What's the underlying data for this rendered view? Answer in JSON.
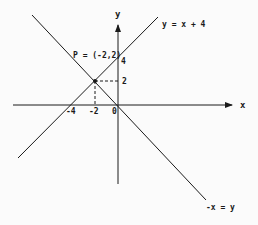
{
  "diagram": {
    "axes": {
      "x_label": "x",
      "y_label": "y",
      "origin_label": "0"
    },
    "ticks": {
      "x_neg4": "-4",
      "x_neg2": "-2",
      "y_2": "2",
      "y_4": "4"
    },
    "lines": [
      {
        "equation": "y = x + 4",
        "slope": 1,
        "intercept": 4
      },
      {
        "equation": "-x = y",
        "slope": -1,
        "intercept": 0
      }
    ],
    "point": {
      "label": "P = (-2,2)",
      "x": -2,
      "y": 2
    },
    "colors": {
      "stroke": "#1a1a1a",
      "background": "#fbfbfb"
    }
  }
}
